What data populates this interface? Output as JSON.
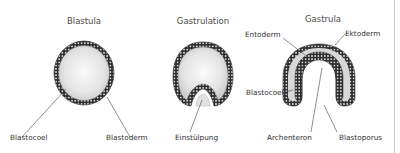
{
  "figure": {
    "panels": [
      {
        "title": "Blastula",
        "labels": [
          "Blastocoel",
          "Blastoderm"
        ]
      },
      {
        "title": "Gastrulation",
        "labels": [
          "Einstülpung"
        ]
      },
      {
        "title": "Gastrula",
        "labels": [
          "Entoderm",
          "Ektoderm",
          "Blastocoel",
          "Archenteron",
          "Blastoporus"
        ]
      }
    ]
  },
  "colors": {
    "cell_layer": "#3a3a3a",
    "cavity_light": "#f4f4f4",
    "cavity_dark": "#cfcfcf",
    "blastocoel_fill": "#d6d6d6"
  }
}
